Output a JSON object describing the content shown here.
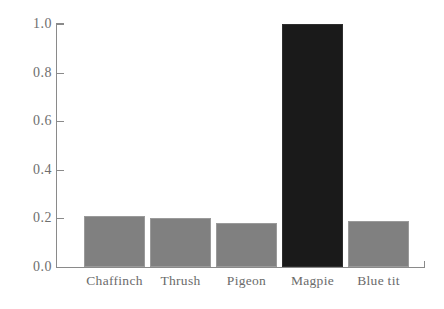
{
  "chart_data": {
    "type": "bar",
    "title": "",
    "subtitle": "",
    "xlabel": "",
    "ylabel": "",
    "categories": [
      "Chaffinch",
      "Thrush",
      "Pigeon",
      "Magpie",
      "Blue tit"
    ],
    "values": [
      0.21,
      0.2,
      0.18,
      1.0,
      0.19
    ],
    "ylim": [
      0.0,
      1.0
    ],
    "yticks": [
      "0.0",
      "0.2",
      "0.4",
      "0.6",
      "0.8",
      "1.0"
    ],
    "ytick_values": [
      0.0,
      0.2,
      0.4,
      0.6,
      0.8,
      1.0
    ],
    "grid": false,
    "legend": "none",
    "bar_colors": [
      "#808080",
      "#808080",
      "#808080",
      "#1a1a1a",
      "#808080"
    ],
    "highlighted_category": "Magpie",
    "colors": {
      "bar_default": "#808080",
      "bar_highlight": "#1a1a1a",
      "axis": "#8a8a8a",
      "tick_label": "#6e6e6e",
      "category_label": "#6b6b6b",
      "background": "#ffffff"
    }
  }
}
